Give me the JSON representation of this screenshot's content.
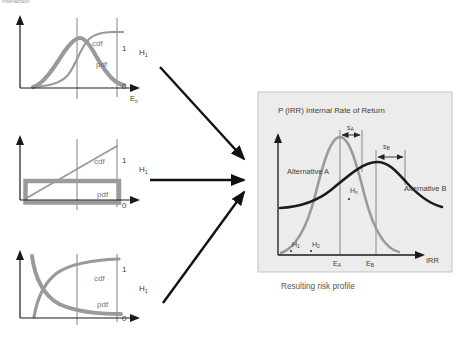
{
  "clipped_text": "interaction",
  "colors": {
    "curve_gray": "#9a9a9a",
    "curve_black": "#1b1b1b",
    "box_fill": "#ececec",
    "box_border": "#c4c4c4",
    "label_gray": "#757575",
    "label_dark": "#3f3f3f"
  },
  "small_charts": [
    {
      "name": "normal-distribution-chart",
      "cdf": "cdf",
      "pdf": "pdf",
      "one": "1",
      "zero": "0",
      "hypothesis": {
        "main": "H",
        "sub": "1"
      },
      "x_label": {
        "main": "E",
        "sub": "it"
      }
    },
    {
      "name": "uniform-distribution-chart",
      "cdf": "cdf",
      "pdf": "pdf",
      "one": "1",
      "zero": "0",
      "hypothesis": {
        "main": "H",
        "sub": "1"
      }
    },
    {
      "name": "exponential-distribution-chart",
      "cdf": "cdf",
      "pdf": "pdf",
      "one": "1",
      "zero": "0",
      "hypothesis": {
        "main": "H",
        "sub": "1"
      }
    }
  ],
  "result_chart": {
    "title": "P (IRR) Internal Rate of Return",
    "caption": "Resulting risk profile",
    "x_axis_label": "IRR",
    "alternative_a_label": "Alternative A",
    "alternative_b_label": "Alternative B",
    "sigma_a": {
      "main": "s",
      "sub": "A"
    },
    "sigma_b": {
      "main": "s",
      "sub": "B"
    },
    "mean_a": {
      "main": "E",
      "sub": "A"
    },
    "mean_b": {
      "main": "E",
      "sub": "B"
    },
    "h1": {
      "main": "H",
      "sub": "1"
    },
    "h2": {
      "main": "H",
      "sub": "2"
    },
    "hn": {
      "main": "H",
      "sub": "n"
    }
  }
}
